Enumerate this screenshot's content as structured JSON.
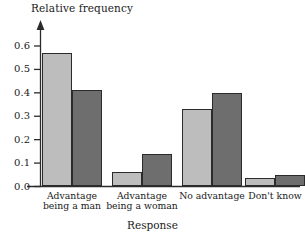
{
  "chart_data": {
    "type": "bar",
    "title": "",
    "subtitle": "",
    "xlabel": "Response",
    "ylabel": "Relative frequency",
    "categories": [
      "Advantage\nbeing a man",
      "Advantage\nbeing a woman",
      "No advantage",
      "Don't know"
    ],
    "series": [
      {
        "name": "series-1",
        "color": "#bdbdbd",
        "values": [
          0.57,
          0.06,
          0.33,
          0.035
        ]
      },
      {
        "name": "series-2",
        "color": "#6e6e6e",
        "values": [
          0.41,
          0.14,
          0.4,
          0.05
        ]
      }
    ],
    "ylim": [
      0.0,
      0.62
    ],
    "yticks": [
      "0.0",
      "0.1",
      "0.2",
      "0.3",
      "0.4",
      "0.5",
      "0.6"
    ],
    "ytick_values": [
      0.0,
      0.1,
      0.2,
      0.3,
      0.4,
      0.5,
      0.6
    ],
    "grid": false,
    "legend": "none",
    "axis_color": "#2b2b2b"
  }
}
